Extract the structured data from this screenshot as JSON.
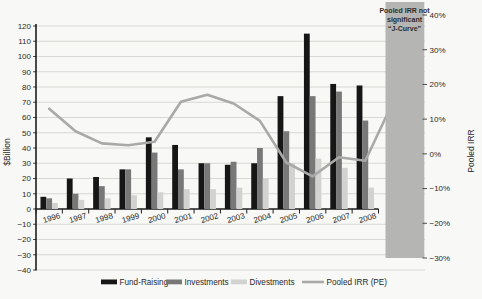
{
  "figure": {
    "background": "#f8f8f6",
    "annotation_box": {
      "lines": [
        "Pooled IRR not",
        "significant",
        "“J-Curve”"
      ],
      "fill": "#b5b5b3",
      "text_color": "#2d2d2d"
    },
    "left_axis": {
      "title": "$Billion",
      "min": -40,
      "max": 120,
      "step": 10,
      "ticks": [
        120,
        110,
        100,
        90,
        80,
        70,
        60,
        50,
        40,
        30,
        20,
        10,
        0,
        -10,
        -20,
        -30,
        -40
      ],
      "tick_labels": [
        "120",
        "110",
        "100",
        "90",
        "80",
        "70",
        "60",
        "50",
        "40",
        "30",
        "20",
        "10",
        "0",
        "−10",
        "−20",
        "−30",
        "−40"
      ]
    },
    "right_axis": {
      "title": "Pooled IRR",
      "min": -30,
      "max": 40,
      "step": 10,
      "ticks": [
        40,
        30,
        20,
        10,
        0,
        -10,
        -20,
        -30
      ],
      "tick_labels": [
        "40%",
        "30%",
        "20%",
        "10%",
        "0%",
        "−10%",
        "−20%",
        "−30%"
      ]
    },
    "legend": [
      {
        "label": "Fund-Raising",
        "type": "bar",
        "color": "#161616"
      },
      {
        "label": "Investments",
        "type": "bar",
        "color": "#787878"
      },
      {
        "label": "Divestments",
        "type": "bar",
        "color": "#d2d2d0"
      },
      {
        "label": "Pooled IRR (PE)",
        "type": "line",
        "color": "#a9a9a7"
      }
    ],
    "colors": {
      "gridline": "#cfcfcd",
      "axis": "#1e1e1e",
      "line_series": "#a9a9a7"
    }
  },
  "chart_data": {
    "type": "bar",
    "subtype": "combo bar+line, dual axis",
    "title": "",
    "xlabel": "",
    "ylabel": "$Billion",
    "ylabel_right": "Pooled IRR",
    "ylim": [
      -40,
      120
    ],
    "ylim_right": [
      -30,
      40
    ],
    "grid": true,
    "legend_position": "bottom",
    "categories": [
      "1996",
      "1997",
      "1998",
      "1999",
      "2000",
      "2001",
      "2002",
      "2003",
      "2004",
      "2005",
      "2006",
      "2007",
      "2008"
    ],
    "series": [
      {
        "name": "Fund-Raising",
        "type": "bar",
        "axis": "left",
        "values": [
          8,
          20,
          21,
          26,
          47,
          42,
          30,
          29,
          30,
          74,
          115,
          82,
          81
        ]
      },
      {
        "name": "Investments",
        "type": "bar",
        "axis": "left",
        "values": [
          7,
          10,
          15,
          26,
          37,
          26,
          30,
          31,
          40,
          51,
          74,
          77,
          58
        ]
      },
      {
        "name": "Divestments",
        "type": "bar",
        "axis": "left",
        "values": [
          4,
          6,
          7,
          9,
          11,
          13,
          13,
          14,
          20,
          30,
          33,
          27,
          14
        ]
      },
      {
        "name": "Pooled IRR (PE)",
        "type": "line",
        "axis": "right",
        "unit": "%",
        "values": [
          13,
          6.5,
          3,
          2.5,
          3.5,
          15,
          17,
          14.5,
          9.5,
          -2.5,
          -6.5,
          -1,
          -2
        ],
        "extension": {
          "note": "line rises steeply into shaded not-significant region after 2008",
          "end_value_pct": 12.5
        }
      }
    ],
    "annotation": "Pooled IRR not significant “J-Curve”"
  }
}
